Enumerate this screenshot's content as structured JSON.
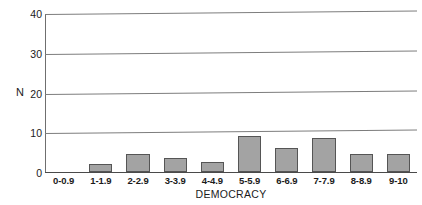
{
  "chart_data": {
    "type": "bar",
    "title": "",
    "xlabel": "DEMOCRACY",
    "ylabel": "N",
    "categories": [
      "0-0.9",
      "1-1.9",
      "2-2.9",
      "3-3.9",
      "4-4.9",
      "5-5.9",
      "6-6.9",
      "7-7.9",
      "8-8.9",
      "9-10"
    ],
    "values": [
      0,
      2,
      4.5,
      3.5,
      2.5,
      9,
      6,
      8.5,
      4.5,
      4.5
    ],
    "ylim": [
      0,
      40
    ],
    "yticks": [
      0,
      10,
      20,
      30,
      40
    ],
    "grid": true,
    "legend": false,
    "bar_color": "#a3a3a3",
    "bar_edge_color": "#555555",
    "axis_color": "#4a4a4a",
    "grid_color": "#7d7d7d",
    "text_color": "#1b1b1b"
  }
}
